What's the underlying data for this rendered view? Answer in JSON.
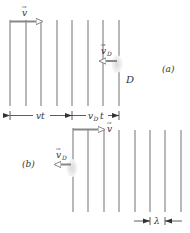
{
  "diagram": {
    "panel_a": {
      "label": "(a)",
      "source_label": "D",
      "wave_velocity_label": "v",
      "detector_velocity_label": "v",
      "detector_velocity_subscript": "D",
      "dim_vt": "vt",
      "dim_vDt_main": "v",
      "dim_vDt_sub": "D",
      "dim_vDt_tail": "t",
      "wavefront_x": [
        10,
        26,
        41,
        57,
        72,
        88,
        103,
        119
      ],
      "wavefront_y": [
        20,
        106
      ]
    },
    "panel_b": {
      "label": "(b)",
      "wave_velocity_label": "v",
      "detector_velocity_label": "v",
      "detector_velocity_subscript": "D",
      "wavelength_label": "λ",
      "wavefront_x": [
        73,
        88,
        104,
        119,
        135,
        150,
        165,
        181
      ],
      "wavefront_y": [
        128,
        212
      ]
    },
    "colors": {
      "wavefront": "#9a9a9a",
      "arrow": "#8a8a8a",
      "text": "#333333",
      "detector": "#e6e6e6"
    }
  }
}
